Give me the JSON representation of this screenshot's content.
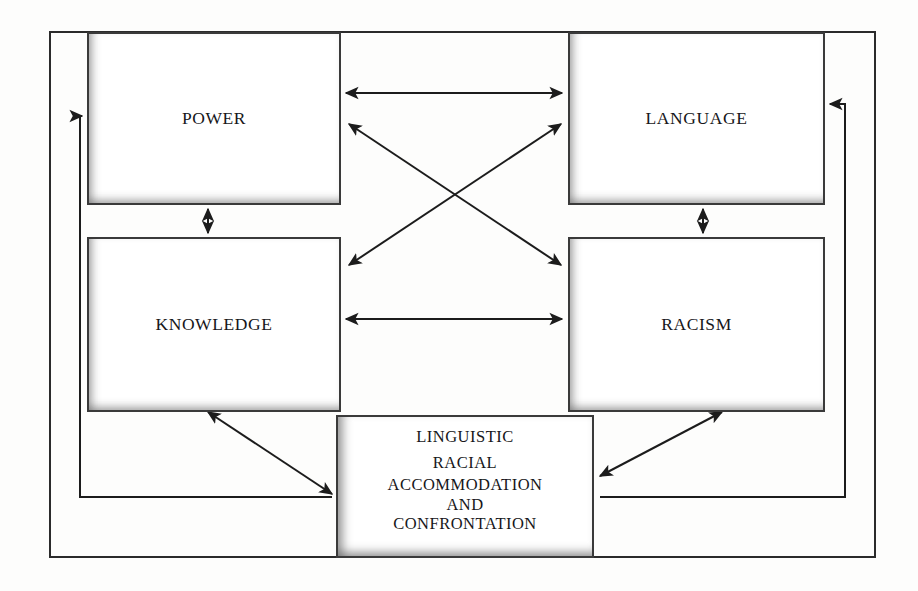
{
  "diagram": {
    "title_present": false,
    "background_color": "#fdfdfc",
    "line_color": "#2b2b2b",
    "text_color": "#17171a",
    "nodes": {
      "power": {
        "label": "POWER"
      },
      "language": {
        "label": "LANGUAGE"
      },
      "knowledge": {
        "label": "KNOWLEDGE"
      },
      "racism": {
        "label": "RACISM"
      },
      "outcome": {
        "line1": "LINGUISTIC",
        "line2": "RACIAL",
        "line3": "ACCOMMODATION",
        "line4": "AND",
        "line5": "CONFRONTATION"
      }
    },
    "connections": [
      {
        "from": "power",
        "to": "language",
        "style": "double-arrow",
        "orientation": "horizontal"
      },
      {
        "from": "knowledge",
        "to": "racism",
        "style": "double-arrow",
        "orientation": "horizontal"
      },
      {
        "from": "power",
        "to": "knowledge",
        "style": "double-arrow",
        "orientation": "vertical"
      },
      {
        "from": "language",
        "to": "racism",
        "style": "double-arrow",
        "orientation": "vertical"
      },
      {
        "from": "power",
        "to": "racism",
        "style": "double-arrow",
        "orientation": "diagonal"
      },
      {
        "from": "language",
        "to": "knowledge",
        "style": "double-arrow",
        "orientation": "diagonal"
      },
      {
        "from": "knowledge",
        "to": "outcome",
        "style": "double-arrow",
        "orientation": "diagonal"
      },
      {
        "from": "racism",
        "to": "outcome",
        "style": "double-arrow",
        "orientation": "diagonal"
      },
      {
        "from": "outcome",
        "to": "power",
        "style": "single-arrow",
        "orientation": "left-feedback-loop"
      },
      {
        "from": "outcome",
        "to": "language",
        "style": "single-arrow",
        "orientation": "right-feedback-loop"
      }
    ]
  }
}
